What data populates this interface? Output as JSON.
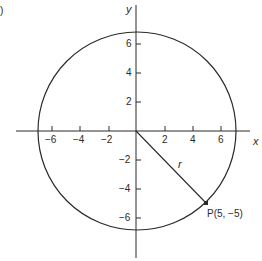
{
  "figure": {
    "corner_label": ")",
    "axes": {
      "x_label": "x",
      "y_label": "y",
      "x_ticks": [
        "−6",
        "−4",
        "−2",
        "2",
        "4",
        "6"
      ],
      "y_ticks": [
        "6",
        "4",
        "2",
        "−2",
        "−4",
        "−6"
      ]
    },
    "circle": {
      "center": [
        0,
        0
      ],
      "radius_label": "r"
    },
    "point": {
      "label": "P(5, −5)",
      "x": 5,
      "y": -5
    },
    "colors": {
      "line": "#2a2a2a",
      "background": "#ffffff"
    }
  }
}
